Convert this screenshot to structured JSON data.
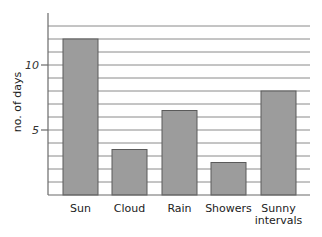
{
  "chart_data": {
    "type": "bar",
    "title": "",
    "xlabel": "",
    "ylabel": "no. of days",
    "categories": [
      "Sun",
      "Cloud",
      "Rain",
      "Showers",
      "Sunny intervals"
    ],
    "category_lines": [
      [
        "Sun"
      ],
      [
        "Cloud"
      ],
      [
        "Rain"
      ],
      [
        "Showers"
      ],
      [
        "Sunny",
        "intervals"
      ]
    ],
    "values": [
      12,
      3.5,
      6.5,
      2.5,
      8
    ],
    "ylim": [
      0,
      13
    ],
    "yticks": [
      5,
      10
    ],
    "ytick_labels": [
      "5",
      "10"
    ],
    "grid": true,
    "grid_step": 1,
    "legend": null,
    "colors": {
      "bar": "#9c9c9c",
      "bar_edge": "#5a5a5a",
      "grid": "#8a8a8a"
    }
  }
}
